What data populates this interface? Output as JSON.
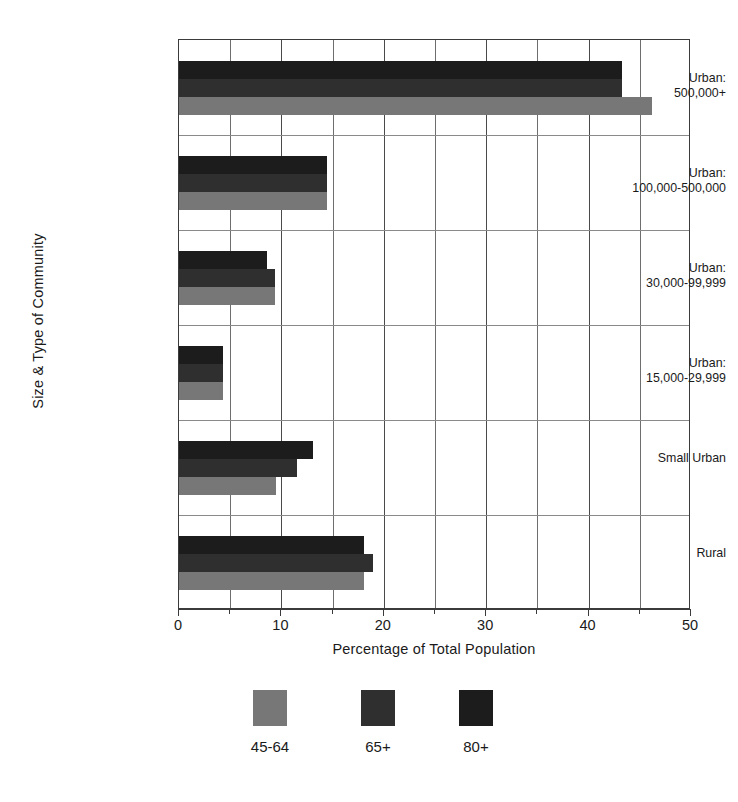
{
  "chart_data": {
    "type": "bar",
    "orientation": "horizontal",
    "title": "",
    "xlabel": "Percentage of Total Population",
    "ylabel": "Size & Type of Community",
    "xlim": [
      0,
      50
    ],
    "ylim": null,
    "grid": true,
    "legend_position": "bottom",
    "categories": [
      "Urban:\n500,000+",
      "Urban:\n100,000-500,000",
      "Urban:\n30,000-99,999",
      "Urban:\n15,000-29,999",
      "Small Urban",
      "Rural"
    ],
    "series": [
      {
        "name": "45-64",
        "color": "#777777",
        "values": [
          46.2,
          14.5,
          9.4,
          4.3,
          9.5,
          18.1
        ]
      },
      {
        "name": "65+",
        "color": "#2f2f2f",
        "values": [
          43.3,
          14.5,
          9.4,
          4.3,
          11.5,
          18.9
        ]
      },
      {
        "name": "80+",
        "color": "#1c1c1c",
        "values": [
          43.3,
          14.5,
          8.6,
          4.3,
          13.1,
          18.1
        ]
      }
    ],
    "x_major_ticks": [
      0,
      10,
      20,
      30,
      40,
      50
    ],
    "x_minor_ticks": [
      5,
      15,
      25,
      35,
      45
    ],
    "x_tick_labels": [
      "0",
      "10",
      "20",
      "30",
      "40",
      "50"
    ]
  },
  "axes": {
    "y_title": "Size & Type of Community",
    "x_title": "Percentage of Total Population"
  },
  "legend": {
    "items": [
      {
        "label": "45-64",
        "color": "#777777"
      },
      {
        "label": "65+",
        "color": "#2f2f2f"
      },
      {
        "label": "80+",
        "color": "#1c1c1c"
      }
    ]
  },
  "colors": {
    "bar_45_64": "#777777",
    "bar_65_plus": "#2f2f2f",
    "bar_80_plus": "#1c1c1c",
    "axis": "#3b3b3b",
    "grid": "#6e6e6e",
    "background": "#ffffff"
  }
}
